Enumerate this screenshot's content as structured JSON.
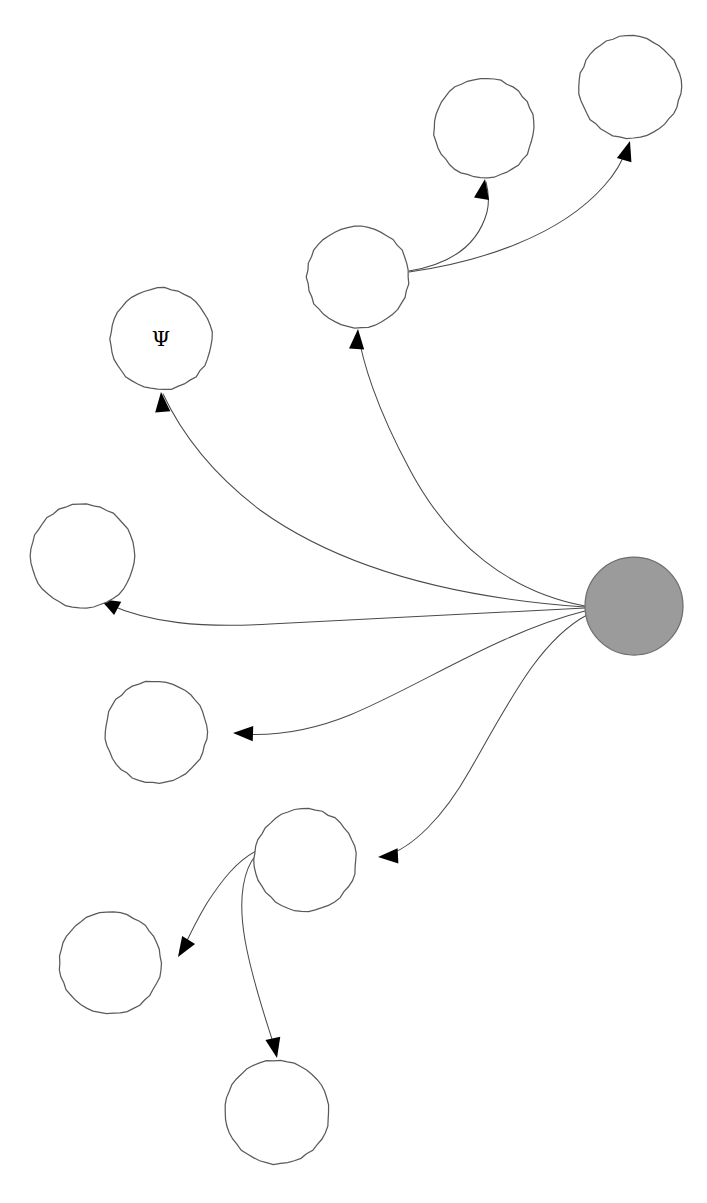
{
  "diagram": {
    "type": "node-link-graph",
    "canvas": {
      "width": 707,
      "height": 1203
    },
    "background_color": "#ffffff",
    "palette": {
      "node_fill": "#ffffff",
      "node_stroke": "#5a5a5a",
      "root_fill": "#9b9b9b",
      "root_stroke": "#6e6e6e",
      "edge_stroke": "#4a4a4a",
      "arrow_fill": "#000000",
      "label_color": "#000000"
    },
    "node_count": 10,
    "edge_count": 9,
    "nodes": [
      {
        "id": "n-root",
        "name": "root-hub-node",
        "label": "",
        "cx": 634,
        "cy": 606,
        "r": 49,
        "filled": true
      },
      {
        "id": "n-psi",
        "name": "psi-node",
        "label": "Ψ",
        "cx": 161,
        "cy": 339,
        "r": 51,
        "filled": false
      },
      {
        "id": "n-upper-mid",
        "name": "upper-mid-branch-node",
        "label": "",
        "cx": 358,
        "cy": 277,
        "r": 51,
        "filled": false
      },
      {
        "id": "n-top-mid",
        "name": "top-middle-leaf-node",
        "label": "",
        "cx": 484,
        "cy": 128,
        "r": 50,
        "filled": false
      },
      {
        "id": "n-top-right",
        "name": "top-right-leaf-node",
        "label": "",
        "cx": 630,
        "cy": 87,
        "r": 51,
        "filled": false
      },
      {
        "id": "n-left-mid",
        "name": "left-middle-leaf-node",
        "label": "",
        "cx": 83,
        "cy": 556,
        "r": 52,
        "filled": false
      },
      {
        "id": "n-left-low",
        "name": "left-lower-leaf-node",
        "label": "",
        "cx": 156,
        "cy": 732,
        "r": 51,
        "filled": false
      },
      {
        "id": "n-lower-mid",
        "name": "lower-mid-branch-node",
        "label": "",
        "cx": 305,
        "cy": 860,
        "r": 51,
        "filled": false
      },
      {
        "id": "n-bottom-left",
        "name": "bottom-left-leaf-node",
        "label": "",
        "cx": 110,
        "cy": 963,
        "r": 51,
        "filled": false
      },
      {
        "id": "n-bottom",
        "name": "bottom-leaf-node",
        "label": "",
        "cx": 277,
        "cy": 1112,
        "r": 52,
        "filled": false
      }
    ],
    "edges": [
      {
        "id": "e-root-psi",
        "name": "edge-root-to-psi",
        "from": "n-root",
        "to": "n-psi",
        "path": "M 585 607 C 470 599 350 575 260 510 C 210 472 180 430 163 394",
        "arrow": {
          "x": 161,
          "y": 392,
          "angle": -95
        }
      },
      {
        "id": "e-root-upper-mid",
        "name": "edge-root-to-upper-mid",
        "from": "n-root",
        "to": "n-upper-mid",
        "path": "M 585 606 C 510 592 450 545 410 470 C 376 407 362 360 358 332",
        "arrow": {
          "x": 358,
          "y": 329,
          "angle": -86
        }
      },
      {
        "id": "e-upper-mid-top-mid",
        "name": "edge-upper-mid-to-top-mid",
        "from": "n-upper-mid",
        "to": "n-top-mid",
        "path": "M 409 271 C 452 264 478 245 487 212 C 490 200 488 190 486 182",
        "arrow": {
          "x": 485,
          "y": 179,
          "angle": -80
        }
      },
      {
        "id": "e-upper-mid-top-right",
        "name": "edge-upper-mid-to-top-right",
        "from": "n-upper-mid",
        "to": "n-top-right",
        "path": "M 409 272 C 480 262 560 236 604 186 C 616 173 623 160 628 146",
        "arrow": {
          "x": 630,
          "y": 141,
          "angle": -73
        }
      },
      {
        "id": "e-root-left-mid",
        "name": "edge-root-to-left-mid",
        "from": "n-root",
        "to": "n-left-mid",
        "path": "M 585 608 C 470 614 350 620 270 624 C 200 628 150 623 108 604",
        "arrow": {
          "x": 100,
          "y": 599,
          "angle": -152
        }
      },
      {
        "id": "e-root-left-low",
        "name": "edge-root-to-left-low",
        "from": "n-root",
        "to": "n-left-low",
        "path": "M 585 611 C 500 632 420 686 350 715 C 303 734 268 736 240 734",
        "arrow": {
          "x": 233,
          "y": 733,
          "angle": 182
        }
      },
      {
        "id": "e-root-lower-mid",
        "name": "edge-root-to-lower-mid",
        "from": "n-root",
        "to": "n-lower-mid",
        "path": "M 587 615 C 540 640 510 700 470 770 C 443 818 412 848 385 856",
        "arrow": {
          "x": 378,
          "y": 857,
          "angle": 177
        }
      },
      {
        "id": "e-lower-mid-bottom-left",
        "name": "edge-lower-mid-to-bottom-left",
        "from": "n-lower-mid",
        "to": "n-bottom-left",
        "path": "M 256 851 C 236 862 222 880 207 903 C 198 918 190 934 183 949",
        "arrow": {
          "x": 178,
          "y": 957,
          "angle": 122
        }
      },
      {
        "id": "e-lower-mid-bottom",
        "name": "edge-lower-mid-to-bottom",
        "from": "n-lower-mid",
        "to": "n-bottom",
        "path": "M 261 850 C 242 866 238 900 245 940 C 253 985 268 1025 276 1052",
        "arrow": {
          "x": 277,
          "y": 1058,
          "angle": 78
        }
      }
    ]
  }
}
